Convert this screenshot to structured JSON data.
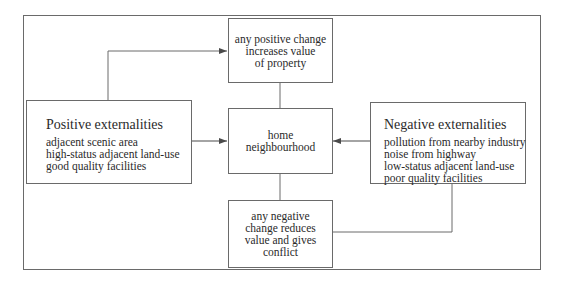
{
  "diagram": {
    "type": "flow-diagram",
    "nodes": {
      "positive_change": {
        "lines": [
          "any positive change",
          "increases value",
          "of property"
        ]
      },
      "home": {
        "lines": [
          "home",
          "neighbourhood"
        ]
      },
      "negative_change": {
        "lines": [
          "any negative",
          "change reduces",
          "value and gives",
          "conflict"
        ]
      },
      "positive_externalities": {
        "title": "Positive externalities",
        "items": [
          "adjacent scenic area",
          "high-status adjacent land-use",
          "good quality facilities"
        ]
      },
      "negative_externalities": {
        "title": "Negative externalities",
        "items": [
          "pollution from nearby industry",
          "noise from highway",
          "low-status adjacent land-use",
          "poor quality facilities"
        ]
      }
    },
    "edges": [
      {
        "from": "positive_externalities",
        "to": "positive_change",
        "arrow": true
      },
      {
        "from": "positive_externalities",
        "to": "home",
        "arrow": true
      },
      {
        "from": "negative_externalities",
        "to": "home",
        "arrow": true
      },
      {
        "from": "positive_change",
        "to": "home",
        "arrow": false
      },
      {
        "from": "home",
        "to": "negative_change",
        "arrow": false
      },
      {
        "from": "negative_externalities",
        "to": "negative_change",
        "arrow": false
      }
    ],
    "colors": {
      "line": "#6a6a6a",
      "text": "#2a2a2a",
      "background": "#ffffff"
    }
  }
}
